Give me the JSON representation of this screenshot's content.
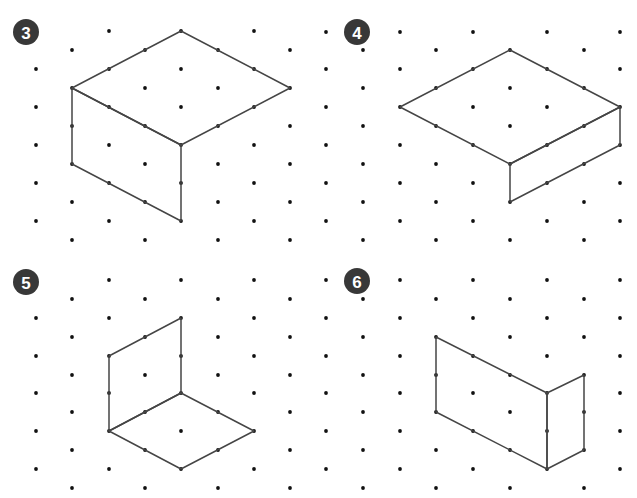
{
  "colors": {
    "badge": "#383838",
    "badge_text": "#ffffff",
    "dot": "#111111",
    "edge": "#454545",
    "background": "#ffffff"
  },
  "panels": [
    {
      "id": "3",
      "label": "3",
      "badge": {
        "cx": 26,
        "cy": 32,
        "r": 13
      },
      "grid": {
        "even_cols": [
          36,
          109,
          181,
          254
        ],
        "odd_cols": [
          72,
          145,
          218,
          290
        ],
        "even_rows": [
          31,
          69,
          107,
          145,
          183,
          221
        ],
        "odd_rows": [
          50,
          88,
          126,
          164,
          202,
          240
        ],
        "hidden": [
          [
            36,
            31
          ]
        ]
      },
      "shape": {
        "name": "cuboid-wide-top",
        "faces": [
          [
            [
              181,
              31
            ],
            [
              290,
              88
            ],
            [
              181,
              145
            ],
            [
              72,
              88
            ]
          ],
          [
            [
              72,
              88
            ],
            [
              181,
              145
            ],
            [
              181,
              221
            ],
            [
              72,
              164
            ]
          ]
        ]
      }
    },
    {
      "id": "4",
      "label": "4",
      "badge": {
        "cx": 357,
        "cy": 32,
        "r": 13
      },
      "grid": {
        "even_cols": [
          326,
          400,
          473,
          547,
          620
        ],
        "odd_cols": [
          363,
          436,
          510,
          584
        ],
        "even_rows": [
          32,
          69,
          107,
          145,
          183,
          221
        ],
        "odd_rows": [
          50,
          88,
          126,
          164,
          202,
          240
        ],
        "hidden": []
      },
      "shape": {
        "name": "flat-slab",
        "faces": [
          [
            [
              510,
              50
            ],
            [
              620,
              107
            ],
            [
              510,
              164
            ],
            [
              400,
              107
            ]
          ],
          [
            [
              510,
              164
            ],
            [
              620,
              107
            ],
            [
              620,
              145
            ],
            [
              510,
              202
            ]
          ]
        ]
      }
    },
    {
      "id": "5",
      "label": "5",
      "badge": {
        "cx": 26,
        "cy": 282,
        "r": 13
      },
      "grid": {
        "even_cols": [
          36,
          109,
          181,
          254
        ],
        "odd_cols": [
          72,
          145,
          218,
          290
        ],
        "even_rows": [
          280,
          318,
          356,
          393,
          431,
          469
        ],
        "odd_rows": [
          299,
          337,
          375,
          412,
          450,
          488
        ],
        "hidden": [
          [
            36,
            280
          ]
        ]
      },
      "shape": {
        "name": "wall-and-floor",
        "faces": [
          [
            [
              109,
              356
            ],
            [
              181,
              318
            ],
            [
              181,
              393
            ],
            [
              109,
              431
            ]
          ],
          [
            [
              109,
              431
            ],
            [
              181,
              393
            ],
            [
              254,
              431
            ],
            [
              181,
              469
            ]
          ]
        ]
      }
    },
    {
      "id": "6",
      "label": "6",
      "badge": {
        "cx": 357,
        "cy": 281,
        "r": 13
      },
      "grid": {
        "even_cols": [
          326,
          400,
          473,
          547,
          620
        ],
        "odd_cols": [
          363,
          436,
          510,
          584
        ],
        "even_rows": [
          280,
          318,
          356,
          393,
          431,
          469
        ],
        "odd_rows": [
          299,
          337,
          375,
          412,
          450,
          488
        ],
        "hidden": []
      },
      "shape": {
        "name": "folded-panels",
        "faces": [
          [
            [
              436,
              337
            ],
            [
              547,
              393
            ],
            [
              547,
              469
            ],
            [
              436,
              412
            ]
          ],
          [
            [
              547,
              393
            ],
            [
              584,
              375
            ],
            [
              584,
              450
            ],
            [
              547,
              469
            ]
          ]
        ]
      }
    }
  ]
}
